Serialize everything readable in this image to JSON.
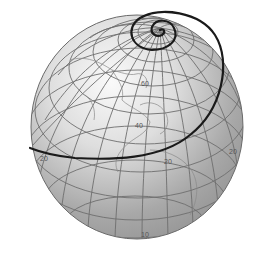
{
  "figure": {
    "colors": {
      "background": "#ffffff",
      "globe_light": "#f2f2f2",
      "globe_dark": "#7a7a7a",
      "graticule": "#6a6a6a",
      "coastline": "#8a8a8a",
      "loxodrome": "#1a1a1a"
    },
    "latitude_labels": [
      {
        "text": "60",
        "x": 141,
        "y": 86
      },
      {
        "text": "40",
        "x": 137,
        "y": 128
      },
      {
        "text": "20",
        "x": 42,
        "y": 161
      },
      {
        "text": "20",
        "x": 166,
        "y": 164
      },
      {
        "text": "20",
        "x": 231,
        "y": 154
      },
      {
        "text": "10",
        "x": 143,
        "y": 237
      }
    ]
  }
}
